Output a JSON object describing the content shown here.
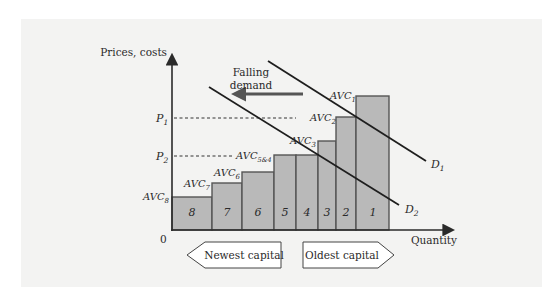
{
  "diagram": {
    "y_axis_label": "Prices, costs",
    "x_axis_label": "Quantity",
    "origin_label": "0",
    "price_levels": [
      {
        "main": "P",
        "sub": "1"
      },
      {
        "main": "P",
        "sub": "2"
      }
    ],
    "annotation": {
      "line1": "Falling",
      "line2": "demand"
    },
    "demand_curves": [
      {
        "main": "D",
        "sub": "1"
      },
      {
        "main": "D",
        "sub": "2"
      }
    ],
    "avc_labels": [
      {
        "main": "AVC",
        "sub": "1"
      },
      {
        "main": "AVC",
        "sub": "2"
      },
      {
        "main": "AVC",
        "sub": "3"
      },
      {
        "main": "AVC",
        "sub": "5&4"
      },
      {
        "main": "AVC",
        "sub": "6"
      },
      {
        "main": "AVC",
        "sub": "7"
      },
      {
        "main": "AVC",
        "sub": "8"
      }
    ],
    "bars": [
      {
        "label": "8"
      },
      {
        "label": "7"
      },
      {
        "label": "6"
      },
      {
        "label": "5"
      },
      {
        "label": "4"
      },
      {
        "label": "3"
      },
      {
        "label": "2"
      },
      {
        "label": "1"
      }
    ],
    "bottom_tags": {
      "left": "Newest capital",
      "right": "Oldest capital"
    },
    "colors": {
      "panel": "#f3f3f2",
      "bar_fill": "#b9b9b9",
      "arrow": "#555555"
    }
  }
}
